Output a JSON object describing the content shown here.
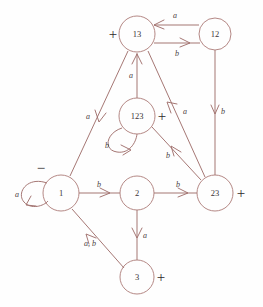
{
  "diagram": {
    "colors": {
      "stroke": "#ab7a77",
      "edge": "#a0706d",
      "node_label": "#3a3436",
      "edge_label": "#4a4042",
      "mark": "#2e2a2b",
      "background": "#fefefe"
    },
    "nodes": [
      {
        "id": "13",
        "label": "13",
        "cx": 137,
        "cy": 34,
        "r": 18,
        "mark": "+",
        "mark_pos": "left"
      },
      {
        "id": "12",
        "label": "12",
        "cx": 215,
        "cy": 34,
        "r": 16,
        "mark": "",
        "mark_pos": ""
      },
      {
        "id": "123",
        "label": "123",
        "cx": 137,
        "cy": 116,
        "r": 18,
        "mark": "+",
        "mark_pos": "right"
      },
      {
        "id": "1",
        "label": "1",
        "cx": 61,
        "cy": 193,
        "r": 18,
        "mark": "−",
        "mark_pos": "above"
      },
      {
        "id": "2",
        "label": "2",
        "cx": 137,
        "cy": 193,
        "r": 17,
        "mark": "",
        "mark_pos": ""
      },
      {
        "id": "23",
        "label": "23",
        "cx": 215,
        "cy": 193,
        "r": 18,
        "mark": "+",
        "mark_pos": "right"
      },
      {
        "id": "3",
        "label": "3",
        "cx": 137,
        "cy": 277,
        "r": 17,
        "mark": "+",
        "mark_pos": "right"
      }
    ],
    "edges": [
      {
        "from": "12",
        "to": "13",
        "label": "a",
        "label_x": 175,
        "label_y": 15
      },
      {
        "from": "13",
        "to": "12",
        "label": "b",
        "label_x": 177,
        "label_y": 53
      },
      {
        "from": "12",
        "to": "23",
        "label": "b",
        "label_x": 223,
        "label_y": 111
      },
      {
        "from": "13",
        "to": "1",
        "label": "a",
        "label_x": 88,
        "label_y": 116
      },
      {
        "from": "123",
        "to": "13",
        "label": "a",
        "label_x": 131,
        "label_y": 75
      },
      {
        "from": "123",
        "to": "123",
        "label": "b",
        "label_x": 107,
        "label_y": 145
      },
      {
        "from": "23",
        "to": "13",
        "label": "a",
        "label_x": 185,
        "label_y": 111
      },
      {
        "from": "23",
        "to": "123",
        "label": "b",
        "label_x": 168,
        "label_y": 155
      },
      {
        "from": "1",
        "to": "1",
        "label": "a",
        "label_x": 17,
        "label_y": 194
      },
      {
        "from": "1",
        "to": "2",
        "label": "b",
        "label_x": 99,
        "label_y": 184
      },
      {
        "from": "2",
        "to": "23",
        "label": "b",
        "label_x": 178,
        "label_y": 184
      },
      {
        "from": "2",
        "to": "3",
        "label": "a",
        "label_x": 145,
        "label_y": 235
      },
      {
        "from": "3",
        "to": "1",
        "label": "a, b",
        "label_x": 90,
        "label_y": 243
      }
    ]
  }
}
